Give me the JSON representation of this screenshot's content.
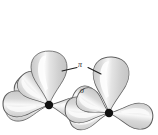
{
  "figure": {
    "type": "orbital-bonding-diagram",
    "title": "",
    "background_color": "#ffffff"
  },
  "labels": {
    "pi": "π",
    "sigma": "σ"
  },
  "colors": {
    "lobe_fill": "#d6d6d6",
    "lobe_fill_light": "#ececec",
    "lobe_highlight": "#fbfbfb",
    "lobe_stroke": "#5e5e5e",
    "atom": "#111111",
    "leader_line": "#1e1e1e",
    "label_text": "#2b2b2b"
  },
  "atoms": [
    {
      "name": "left-atom",
      "cx": 49,
      "cy": 105,
      "r": 4.2
    },
    {
      "name": "right-atom",
      "cx": 109,
      "cy": 113,
      "r": 4.2
    }
  ],
  "orbitals": {
    "left_atom_lobes": [
      {
        "name": "p-lobe-up",
        "angle_deg": -90,
        "length": 54,
        "width": 36
      },
      {
        "name": "p-lobe-upper-left",
        "angle_deg": -132,
        "length": 40,
        "width": 26
      },
      {
        "name": "p-lobe-left",
        "angle_deg": 182,
        "length": 46,
        "width": 26
      },
      {
        "name": "p-lobe-lower-left",
        "angle_deg": 128,
        "length": 40,
        "width": 26
      },
      {
        "name": "p-lobe-down",
        "angle_deg": 86,
        "length": 44,
        "width": 28
      },
      {
        "name": "p-lobe-right",
        "angle_deg": 8,
        "length": 42,
        "width": 24
      }
    ],
    "right_atom_lobes": [
      {
        "name": "p-lobe-up",
        "angle_deg": -87,
        "length": 56,
        "width": 36
      },
      {
        "name": "p-lobe-upper-left",
        "angle_deg": -148,
        "length": 36,
        "width": 24
      },
      {
        "name": "p-lobe-left",
        "angle_deg": 186,
        "length": 44,
        "width": 26
      },
      {
        "name": "p-lobe-right",
        "angle_deg": -6,
        "length": 44,
        "width": 26
      },
      {
        "name": "p-lobe-lower-left",
        "angle_deg": 120,
        "length": 40,
        "width": 26
      },
      {
        "name": "p-lobe-down",
        "angle_deg": 82,
        "length": 40,
        "width": 26
      }
    ]
  },
  "annotations": [
    {
      "name": "pi-leader",
      "label": "π",
      "path": "M 62 71 L 77 68 M 88 68 L 101 74",
      "description": "bent leader line linking the two upper lobes, broken around the pi label"
    },
    {
      "name": "sigma-leader",
      "label": "σ",
      "description": "label placed over the overlap region between the two atoms"
    }
  ]
}
